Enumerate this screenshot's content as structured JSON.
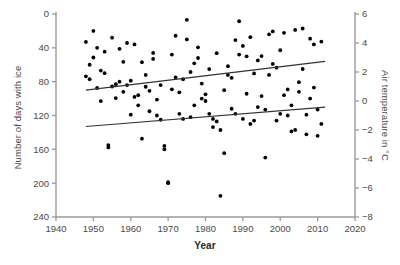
{
  "chart_data": {
    "type": "scatter",
    "title": "",
    "xlabel": "Year",
    "ylabel": "Number of days with ice",
    "ylabel_right": "Air temperature in °C",
    "xlim": [
      1940,
      2020
    ],
    "ylim_left": [
      240,
      0
    ],
    "ylim_right": [
      -8,
      6
    ],
    "left_axis_inverted": true,
    "xticks": [
      1940,
      1950,
      1960,
      1970,
      1980,
      1990,
      2000,
      2010,
      2020
    ],
    "xtick_labels": [
      "1940",
      "1950",
      "1960",
      "1970",
      "1980",
      "1990",
      "2000",
      "2010",
      "2020"
    ],
    "yticks_left": [
      0,
      40,
      80,
      120,
      160,
      200,
      240
    ],
    "ytick_labels_left": [
      "0",
      "40",
      "80",
      "120",
      "160",
      "200",
      "240"
    ],
    "yticks_right": [
      6,
      4,
      2,
      0,
      -2,
      -4,
      -6,
      -8
    ],
    "ytick_labels_right": [
      "6",
      "4",
      "2",
      "0",
      "−2",
      "−4",
      "−6",
      "−8"
    ],
    "grid": false,
    "legend": "none",
    "marker_color": "#000000",
    "axis_color": "#9a9a9a",
    "trend_color": "#333333",
    "series": [
      {
        "name": "Number of days with ice",
        "axis": "left",
        "marker": "filled-circle",
        "points": [
          [
            1948,
            33
          ],
          [
            1949,
            77
          ],
          [
            1950,
            20
          ],
          [
            1951,
            40
          ],
          [
            1952,
            103
          ],
          [
            1953,
            70
          ],
          [
            1954,
            155
          ],
          [
            1955,
            28
          ],
          [
            1956,
            83
          ],
          [
            1957,
            80
          ],
          [
            1958,
            92
          ],
          [
            1959,
            84
          ],
          [
            1960,
            119
          ],
          [
            1961,
            98
          ],
          [
            1962,
            108
          ],
          [
            1963,
            57
          ],
          [
            1964,
            86
          ],
          [
            1965,
            115
          ],
          [
            1966,
            46
          ],
          [
            1967,
            120
          ],
          [
            1968,
            125
          ],
          [
            1969,
            160
          ],
          [
            1970,
            200
          ],
          [
            1971,
            89
          ],
          [
            1972,
            75
          ],
          [
            1973,
            118
          ],
          [
            1974,
            124
          ],
          [
            1975,
            30
          ],
          [
            1976,
            122
          ],
          [
            1977,
            108
          ],
          [
            1978,
            52
          ],
          [
            1979,
            100
          ],
          [
            1980,
            95
          ],
          [
            1981,
            118
          ],
          [
            1982,
            124
          ],
          [
            1983,
            127
          ],
          [
            1984,
            215
          ],
          [
            1985,
            90
          ],
          [
            1986,
            72
          ],
          [
            1987,
            112
          ],
          [
            1988,
            118
          ],
          [
            1989,
            48
          ],
          [
            1990,
            124
          ],
          [
            1991,
            50
          ],
          [
            1992,
            130
          ],
          [
            1993,
            126
          ],
          [
            1994,
            110
          ],
          [
            1995,
            97
          ],
          [
            1996,
            113
          ],
          [
            1997,
            72
          ],
          [
            1998,
            59
          ],
          [
            1999,
            126
          ],
          [
            2000,
            118
          ],
          [
            2001,
            96
          ],
          [
            2002,
            120
          ],
          [
            2003,
            108
          ],
          [
            2004,
            137
          ],
          [
            2005,
            92
          ],
          [
            2006,
            65
          ],
          [
            2007,
            119
          ],
          [
            2008,
            100
          ],
          [
            2009,
            87
          ],
          [
            2010,
            113
          ],
          [
            2011,
            130
          ]
        ]
      },
      {
        "name": "Air temperature",
        "axis": "right",
        "marker": "filled-circle",
        "points": [
          [
            1948,
            1.7
          ],
          [
            1949,
            2.5
          ],
          [
            1950,
            3.0
          ],
          [
            1951,
            0.9
          ],
          [
            1952,
            2.1
          ],
          [
            1953,
            3.4
          ],
          [
            1954,
            -3.2
          ],
          [
            1955,
            1.0
          ],
          [
            1956,
            0.2
          ],
          [
            1957,
            3.6
          ],
          [
            1958,
            2.7
          ],
          [
            1959,
            4.0
          ],
          [
            1960,
            1.4
          ],
          [
            1961,
            3.9
          ],
          [
            1962,
            0.4
          ],
          [
            1963,
            -2.6
          ],
          [
            1964,
            1.8
          ],
          [
            1965,
            0.7
          ],
          [
            1966,
            2.9
          ],
          [
            1967,
            0.1
          ],
          [
            1968,
            1.1
          ],
          [
            1969,
            -3.1
          ],
          [
            1970,
            -5.6
          ],
          [
            1971,
            3.2
          ],
          [
            1972,
            4.5
          ],
          [
            1973,
            0.6
          ],
          [
            1974,
            1.5
          ],
          [
            1975,
            5.6
          ],
          [
            1976,
            2.0
          ],
          [
            1977,
            2.6
          ],
          [
            1978,
            3.7
          ],
          [
            1979,
            1.2
          ],
          [
            1980,
            0.0
          ],
          [
            1981,
            2.2
          ],
          [
            1982,
            -1.8
          ],
          [
            1983,
            3.3
          ],
          [
            1984,
            -2.0
          ],
          [
            1985,
            -3.6
          ],
          [
            1986,
            2.4
          ],
          [
            1987,
            1.6
          ],
          [
            1988,
            4.2
          ],
          [
            1989,
            5.5
          ],
          [
            1990,
            3.8
          ],
          [
            1991,
            0.5
          ],
          [
            1992,
            4.4
          ],
          [
            1993,
            1.9
          ],
          [
            1994,
            2.8
          ],
          [
            1995,
            3.1
          ],
          [
            1996,
            -3.9
          ],
          [
            1997,
            4.6
          ],
          [
            1998,
            4.8
          ],
          [
            1999,
            2.3
          ],
          [
            2000,
            3.5
          ],
          [
            2001,
            4.7
          ],
          [
            2002,
            0.8
          ],
          [
            2003,
            -2.1
          ],
          [
            2004,
            4.9
          ],
          [
            2005,
            1.3
          ],
          [
            2006,
            5.0
          ],
          [
            2007,
            -2.3
          ],
          [
            2008,
            4.3
          ],
          [
            2009,
            3.9
          ],
          [
            2010,
            -2.4
          ],
          [
            2011,
            4.1
          ]
        ]
      }
    ],
    "trend_lines": [
      {
        "name": "ice-days-trend",
        "axis": "left",
        "x0": 1948,
        "y0": 90,
        "x1": 2012,
        "y1": 56
      },
      {
        "name": "air-temperature-trend",
        "axis": "left",
        "x0": 1948,
        "y0": 133,
        "x1": 2012,
        "y1": 110
      }
    ]
  }
}
